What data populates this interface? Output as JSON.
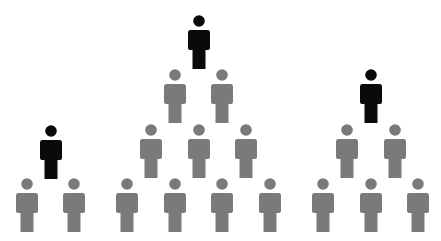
{
  "diagram": {
    "type": "hierarchy-pyramids",
    "colors": {
      "leader": "#0a0a0a",
      "member": "#7a7a7a",
      "background": "#ffffff"
    },
    "groups": [
      {
        "name": "left-group",
        "people": [
          {
            "role": "leader",
            "x": 51,
            "y": 125
          },
          {
            "role": "member",
            "x": 27,
            "y": 178
          },
          {
            "role": "member",
            "x": 74,
            "y": 178
          }
        ]
      },
      {
        "name": "center-group",
        "people": [
          {
            "role": "leader",
            "x": 199,
            "y": 15
          },
          {
            "role": "member",
            "x": 175,
            "y": 69
          },
          {
            "role": "member",
            "x": 222,
            "y": 69
          },
          {
            "role": "member",
            "x": 151,
            "y": 124
          },
          {
            "role": "member",
            "x": 199,
            "y": 124
          },
          {
            "role": "member",
            "x": 246,
            "y": 124
          },
          {
            "role": "member",
            "x": 127,
            "y": 178
          },
          {
            "role": "member",
            "x": 175,
            "y": 178
          },
          {
            "role": "member",
            "x": 222,
            "y": 178
          },
          {
            "role": "member",
            "x": 270,
            "y": 178
          }
        ]
      },
      {
        "name": "right-group",
        "people": [
          {
            "role": "leader",
            "x": 371,
            "y": 69
          },
          {
            "role": "member",
            "x": 347,
            "y": 124
          },
          {
            "role": "member",
            "x": 395,
            "y": 124
          },
          {
            "role": "member",
            "x": 323,
            "y": 178
          },
          {
            "role": "member",
            "x": 371,
            "y": 178
          },
          {
            "role": "member",
            "x": 418,
            "y": 178
          }
        ]
      }
    ]
  }
}
